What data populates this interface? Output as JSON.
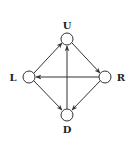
{
  "diagram": {
    "type": "directed-graph",
    "nodes": [
      {
        "id": "U",
        "label": "U"
      },
      {
        "id": "L",
        "label": "L"
      },
      {
        "id": "R",
        "label": "R"
      },
      {
        "id": "D",
        "label": "D"
      }
    ],
    "edges": [
      {
        "from": "L",
        "to": "U"
      },
      {
        "from": "U",
        "to": "R"
      },
      {
        "from": "R",
        "to": "L"
      },
      {
        "from": "L",
        "to": "D"
      },
      {
        "from": "R",
        "to": "D"
      },
      {
        "from": "D",
        "to": "U"
      }
    ],
    "colors": {
      "stroke": "#333333",
      "background": "#ffffff"
    }
  }
}
